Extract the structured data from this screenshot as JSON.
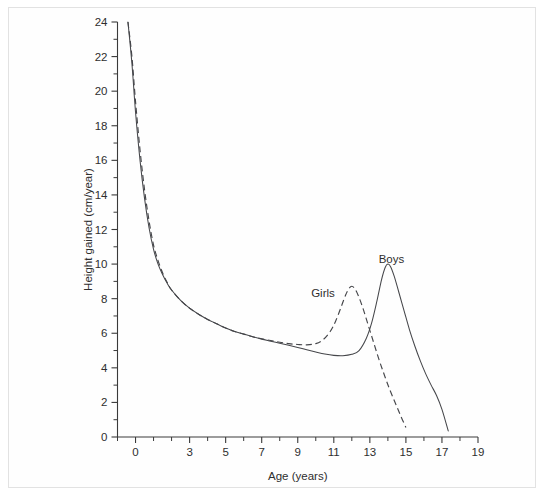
{
  "chart_data": {
    "type": "line",
    "title": "",
    "xlabel": "Age (years)",
    "ylabel": "Height gained (cm/year)",
    "xlim": [
      -1,
      19
    ],
    "ylim": [
      0,
      24
    ],
    "xticks": [
      -1,
      0,
      1,
      2,
      3,
      4,
      5,
      6,
      7,
      8,
      9,
      10,
      11,
      12,
      13,
      14,
      15,
      16,
      17,
      18,
      19
    ],
    "xtick_labels": [
      "",
      "0",
      "",
      "",
      "3",
      "",
      "5",
      "",
      "7",
      "",
      "9",
      "",
      "11",
      "",
      "13",
      "",
      "15",
      "",
      "17",
      "",
      "19"
    ],
    "yticks": [
      0,
      1,
      2,
      3,
      4,
      5,
      6,
      7,
      8,
      9,
      10,
      11,
      12,
      13,
      14,
      15,
      16,
      17,
      18,
      19,
      20,
      21,
      22,
      23,
      24
    ],
    "ytick_labels": [
      "0",
      "",
      "2",
      "",
      "4",
      "",
      "6",
      "",
      "8",
      "",
      "10",
      "",
      "12",
      "",
      "14",
      "",
      "16",
      "",
      "18",
      "",
      "20",
      "",
      "22",
      "",
      "24"
    ],
    "grid": false,
    "legend_position": "inline-annotation",
    "series": [
      {
        "name": "Girls",
        "style": "dashed",
        "label_text": "Girls",
        "label_x": 10.4,
        "label_y": 8.1,
        "peak_age": 12.0,
        "peak_value": 8.7,
        "x": [
          -0.42,
          -0.2,
          0.0,
          0.25,
          0.5,
          0.75,
          1.0,
          1.25,
          1.5,
          1.75,
          2.0,
          2.5,
          3.0,
          3.5,
          4.0,
          4.5,
          5.0,
          5.5,
          6.0,
          6.5,
          7.0,
          7.5,
          8.0,
          8.5,
          9.0,
          9.5,
          10.0,
          10.4,
          10.8,
          11.1,
          11.4,
          11.65,
          11.85,
          12.0,
          12.15,
          12.35,
          12.6,
          12.9,
          13.2,
          13.5,
          13.8,
          14.1,
          14.4,
          14.7,
          15.0
        ],
        "y": [
          24.0,
          22.0,
          19.4,
          16.6,
          14.3,
          12.5,
          11.1,
          10.2,
          9.5,
          8.95,
          8.5,
          7.9,
          7.45,
          7.1,
          6.8,
          6.55,
          6.3,
          6.1,
          5.95,
          5.8,
          5.68,
          5.58,
          5.48,
          5.4,
          5.35,
          5.33,
          5.4,
          5.62,
          6.1,
          6.7,
          7.5,
          8.2,
          8.6,
          8.72,
          8.6,
          8.2,
          7.5,
          6.5,
          5.5,
          4.5,
          3.6,
          2.75,
          2.0,
          1.25,
          0.55
        ]
      },
      {
        "name": "Boys",
        "style": "solid",
        "label_text": "Boys",
        "label_x": 14.2,
        "label_y": 10.05,
        "peak_age": 14.0,
        "peak_value": 10.0,
        "x": [
          -0.42,
          -0.2,
          0.0,
          0.25,
          0.5,
          0.75,
          1.0,
          1.25,
          1.5,
          1.75,
          2.0,
          2.5,
          3.0,
          3.5,
          4.0,
          4.5,
          5.0,
          5.5,
          6.0,
          6.5,
          7.0,
          7.5,
          8.0,
          8.5,
          9.0,
          9.5,
          10.0,
          10.5,
          11.0,
          11.5,
          12.0,
          12.4,
          12.8,
          13.1,
          13.4,
          13.65,
          13.85,
          14.0,
          14.15,
          14.35,
          14.6,
          14.9,
          15.2,
          15.5,
          15.8,
          16.1,
          16.4,
          16.7,
          17.0,
          17.35
        ],
        "y": [
          24.0,
          21.6,
          18.8,
          16.0,
          13.8,
          12.1,
          10.85,
          10.0,
          9.4,
          8.9,
          8.5,
          7.9,
          7.45,
          7.1,
          6.8,
          6.55,
          6.3,
          6.1,
          5.95,
          5.8,
          5.66,
          5.54,
          5.42,
          5.3,
          5.18,
          5.05,
          4.92,
          4.8,
          4.72,
          4.7,
          4.78,
          5.0,
          5.7,
          6.6,
          7.9,
          9.1,
          9.8,
          10.0,
          9.85,
          9.3,
          8.4,
          7.3,
          6.2,
          5.25,
          4.4,
          3.65,
          3.0,
          2.4,
          1.6,
          0.35
        ]
      }
    ]
  },
  "axes": {
    "x_title": "Age (years)",
    "y_title": "Height gained (cm/year)"
  },
  "colors": {
    "curve": "#45464a",
    "axis": "#3a3a3a",
    "frame": "#e2e2e2",
    "background": "#ffffff"
  }
}
